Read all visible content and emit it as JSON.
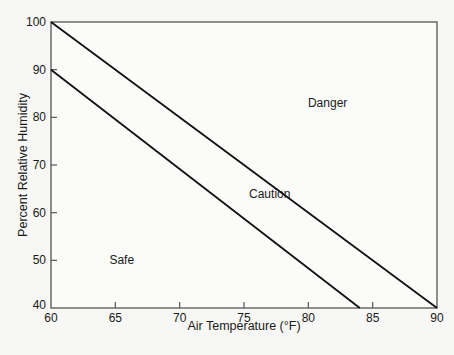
{
  "chart_data": {
    "type": "line",
    "title": "",
    "xlabel": "Air Temperature (°F)",
    "ylabel": "Percent Relative Humidity",
    "xlim": [
      60,
      90
    ],
    "ylim": [
      40,
      100
    ],
    "xticks": [
      60,
      65,
      70,
      75,
      80,
      85,
      90
    ],
    "yticks": [
      40,
      50,
      60,
      70,
      80,
      90,
      100
    ],
    "grid": false,
    "series": [
      {
        "name": "Danger boundary",
        "x": [
          60,
          90
        ],
        "y": [
          100,
          40
        ]
      },
      {
        "name": "Caution boundary",
        "x": [
          60,
          84
        ],
        "y": [
          90,
          40
        ]
      }
    ],
    "annotations": [
      {
        "text": "Danger",
        "x": 81.5,
        "y": 83
      },
      {
        "text": "Caution",
        "x": 77,
        "y": 64
      },
      {
        "text": "Safe",
        "x": 65.5,
        "y": 50
      }
    ]
  },
  "plot": {
    "left": 51,
    "right": 437,
    "top": 22,
    "bottom": 308,
    "frame_color": "#555555",
    "line_color": "#111111"
  }
}
